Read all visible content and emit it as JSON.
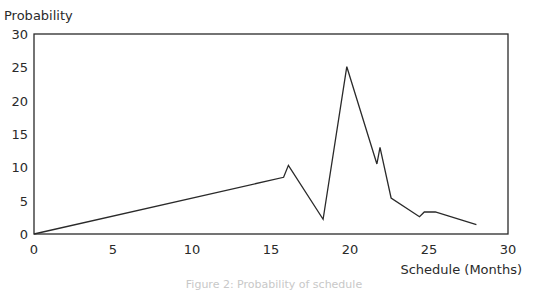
{
  "chart_data": {
    "type": "line",
    "title": "",
    "caption": "Figure 2: Probability of schedule",
    "xlabel": "Schedule (Months)",
    "ylabel": "Probability",
    "xlim": [
      0,
      30
    ],
    "ylim": [
      0,
      30
    ],
    "xticks": [
      0,
      5,
      10,
      15,
      20,
      25,
      30
    ],
    "yticks": [
      0,
      5,
      10,
      15,
      20,
      25,
      30
    ],
    "grid": false,
    "legend": null,
    "series": [
      {
        "name": "Probability",
        "color": "#2a2a2a",
        "x": [
          0,
          15.8,
          16.1,
          18.3,
          19.8,
          21.7,
          21.9,
          22.6,
          24.4,
          24.7,
          25.4,
          28.0
        ],
        "y": [
          0,
          8.5,
          10.3,
          2.2,
          25.1,
          10.5,
          13.0,
          5.4,
          2.6,
          3.3,
          3.3,
          1.4
        ]
      }
    ]
  },
  "labels": {
    "ylabel": "Probability",
    "xlabel": "Schedule (Months)",
    "caption": "Figure 2: Probability of schedule"
  }
}
